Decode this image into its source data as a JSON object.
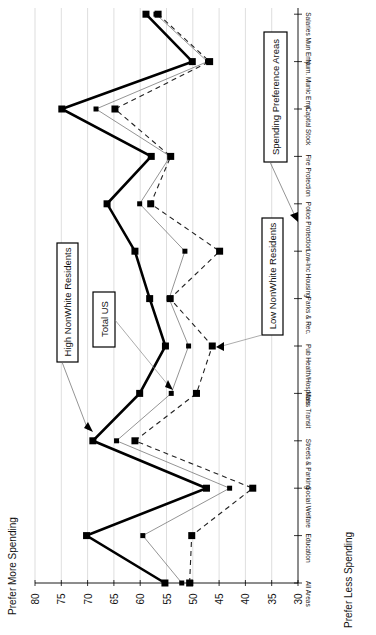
{
  "chart_data": {
    "type": "line",
    "orientation": "rotated-90-cw",
    "title": "",
    "ylabel_top": "Prefer More Spending",
    "ylabel_bottom": "Prefer Less Spending",
    "ylim": [
      30,
      80
    ],
    "yticks": [
      80,
      75,
      70,
      65,
      60,
      55,
      50,
      45,
      40,
      35,
      30
    ],
    "grid": true,
    "categories": [
      "All Areas",
      "Education",
      "Social Welfare",
      "Streets & Parking",
      "Mass Transit",
      "Pub Health/Hospitals",
      "Parks & Rec.",
      "Low-Inc Housing",
      "Police Protection",
      "Fire Protection",
      "Capital Stock",
      "Num. Munic Emp.",
      "Salaries Mun Emp"
    ],
    "series": [
      {
        "name": "High NonWhite Residents",
        "style": "thick-solid",
        "color": "#000000",
        "values": [
          55.3,
          70.2,
          47.4,
          69.0,
          60.1,
          55.2,
          58.2,
          61.0,
          66.3,
          57.9,
          74.9,
          50.1,
          58.9
        ]
      },
      {
        "name": "Total US",
        "style": "thin-solid",
        "color": "#555555",
        "values": [
          52.1,
          59.5,
          43.0,
          64.5,
          54.1,
          50.8,
          54.5,
          51.5,
          60.1,
          54.3,
          68.4,
          47.2,
          57.0
        ]
      },
      {
        "name": "Low NonWhite Residents",
        "style": "dashed",
        "color": "#333333",
        "values": [
          50.6,
          50.2,
          38.6,
          61.0,
          49.3,
          46.3,
          54.3,
          44.9,
          58.0,
          54.2,
          64.8,
          46.8,
          56.6
        ]
      }
    ],
    "annotations": [
      {
        "text": "High NonWhite Residents"
      },
      {
        "text": "Total US"
      },
      {
        "text": "Low NonWhite Residents"
      },
      {
        "text": "Spending Preference Areas"
      }
    ]
  }
}
